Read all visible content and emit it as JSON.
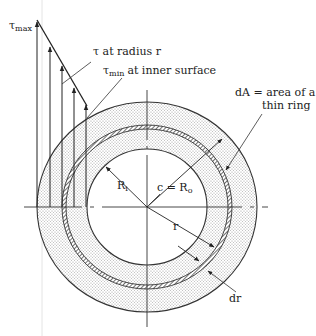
{
  "figure": {
    "labels": {
      "tau_max_symbol": "τ",
      "tau_max_sub": "max",
      "tau_at_radius": "τ at radius r",
      "tau_min_symbol": "τ",
      "tau_min_sub": "min",
      "tau_min_text": "at inner surface",
      "dA_line1": "dA = area of a",
      "dA_line2": "thin ring",
      "Ri_main": "R",
      "Ri_sub": "i",
      "c_Ro_main": "c = R",
      "c_Ro_sub": "o",
      "r": "r",
      "dr": "dr"
    },
    "geometry": {
      "center": [
        147,
        207
      ],
      "outer_radius": [
        110,
        105
      ],
      "inner_radius": [
        60,
        58
      ],
      "thin_ring_radius": [
        84,
        80
      ],
      "stress_arrows": [
        {
          "x": 37,
          "top": 22
        },
        {
          "x": 50,
          "top": 47
        },
        {
          "x": 62,
          "top": 66
        },
        {
          "x": 74,
          "top": 88
        },
        {
          "x": 86,
          "top": 105
        }
      ],
      "baseline_y": 207
    },
    "colors": {
      "line": "#333333",
      "fill_dots": "#cfcfcf",
      "background": "#ffffff"
    }
  }
}
